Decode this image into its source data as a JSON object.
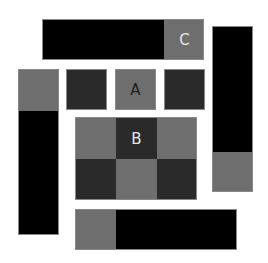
{
  "colors": {
    "gray": "#6e6e6e",
    "dark": "#2a2a2a",
    "black": "#000000",
    "label_dark": "#1e1e1e",
    "label_light": "#e6e6e6"
  },
  "labels": {
    "a": "A",
    "b": "B",
    "c": "C"
  },
  "blocks": [
    {
      "name": "top-bar",
      "x": 42,
      "y": 19,
      "w": 162,
      "h": 41
    },
    {
      "name": "left-column",
      "x": 18,
      "y": 69,
      "w": 41,
      "h": 166
    },
    {
      "name": "right-column",
      "x": 212,
      "y": 26,
      "w": 41,
      "h": 166
    },
    {
      "name": "bottom-bar",
      "x": 75,
      "y": 209,
      "w": 162,
      "h": 41
    },
    {
      "name": "square-dark-left",
      "x": 66,
      "y": 69,
      "w": 41,
      "h": 41
    },
    {
      "name": "square-a",
      "x": 115,
      "y": 69,
      "w": 41,
      "h": 41
    },
    {
      "name": "square-dark-right",
      "x": 164,
      "y": 69,
      "w": 41,
      "h": 41
    },
    {
      "name": "grid-b",
      "x": 75,
      "y": 117,
      "w": 122,
      "h": 83
    }
  ]
}
